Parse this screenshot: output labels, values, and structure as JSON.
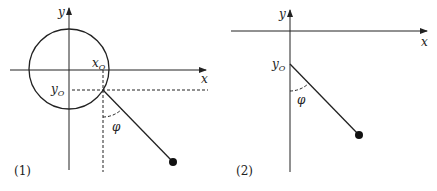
{
  "figures": [
    {
      "id": "1",
      "label": "(1)",
      "axes": {
        "x_label": "x",
        "y_label": "y"
      },
      "labels": {
        "x_origin": "x",
        "x_origin_sub": "O",
        "y_origin": "y",
        "y_origin_sub": "O",
        "angle": "φ"
      },
      "elements": [
        "circle",
        "pendulum-rod",
        "pendulum-bob",
        "dashed-projection-lines",
        "angle-arc"
      ]
    },
    {
      "id": "2",
      "label": "(2)",
      "axes": {
        "x_label": "x",
        "y_label": "y"
      },
      "labels": {
        "y_origin": "y",
        "y_origin_sub": "O",
        "angle": "φ"
      },
      "elements": [
        "pendulum-rod",
        "pendulum-bob",
        "angle-arc"
      ]
    }
  ]
}
